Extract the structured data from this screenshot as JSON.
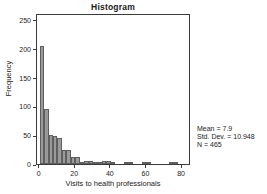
{
  "chart_data": {
    "type": "bar",
    "title": "Histogram",
    "xlabel": "Visits to health professionals",
    "ylabel": "Frequency",
    "xlim": [
      -1.5,
      85
    ],
    "ylim": [
      0,
      262
    ],
    "grid": false,
    "legend": null,
    "bin_width": 2.5,
    "x_ticks": [
      0,
      20,
      40,
      60,
      80
    ],
    "y_ticks": [
      0,
      50,
      100,
      150,
      200,
      250
    ],
    "x_tick_labels": [
      "0",
      "20",
      "40",
      "60",
      "80"
    ],
    "y_tick_labels": [
      "0",
      "50",
      "100",
      "150",
      "200",
      "250"
    ],
    "bar_color": "#9a9a9a",
    "bar_edge_color": "#5f5f5f",
    "bins": [
      {
        "x": 0.0,
        "value": 205
      },
      {
        "x": 2.5,
        "value": 95
      },
      {
        "x": 5.0,
        "value": 50
      },
      {
        "x": 7.5,
        "value": 49
      },
      {
        "x": 10.0,
        "value": 45
      },
      {
        "x": 12.5,
        "value": 25
      },
      {
        "x": 15.0,
        "value": 24
      },
      {
        "x": 17.5,
        "value": 12
      },
      {
        "x": 20.0,
        "value": 12
      },
      {
        "x": 22.5,
        "value": 3
      },
      {
        "x": 25.0,
        "value": 6
      },
      {
        "x": 27.5,
        "value": 6
      },
      {
        "x": 30.0,
        "value": 2
      },
      {
        "x": 32.5,
        "value": 1
      },
      {
        "x": 35.0,
        "value": 6
      },
      {
        "x": 37.5,
        "value": 6
      },
      {
        "x": 40.0,
        "value": 1
      },
      {
        "x": 47.5,
        "value": 2
      },
      {
        "x": 50.0,
        "value": 2
      },
      {
        "x": 57.5,
        "value": 3
      },
      {
        "x": 60.0,
        "value": 3
      },
      {
        "x": 72.5,
        "value": 2
      },
      {
        "x": 75.0,
        "value": 2
      }
    ],
    "categories": [
      "0",
      "2.5",
      "5",
      "7.5",
      "10",
      "12.5",
      "15",
      "17.5",
      "20",
      "22.5",
      "25",
      "27.5",
      "30",
      "32.5",
      "35",
      "37.5",
      "40",
      "47.5",
      "50",
      "57.5",
      "60",
      "72.5",
      "75"
    ],
    "values": [
      205,
      95,
      50,
      49,
      45,
      25,
      24,
      12,
      12,
      3,
      6,
      6,
      2,
      1,
      6,
      6,
      1,
      2,
      2,
      3,
      3,
      2,
      2
    ],
    "annotations": {
      "mean": "Mean = 7.9",
      "std_dev": "Std. Dev. = 10.948",
      "n": "N = 465"
    }
  }
}
